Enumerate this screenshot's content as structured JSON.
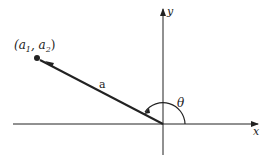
{
  "diagram": {
    "point_label": "(a",
    "point_sub1": "1",
    "comma": ", a",
    "point_sub2": "2",
    "close_paren": ")",
    "vector_label": "a",
    "angle_label": "θ",
    "x_axis_label": "x",
    "y_axis_label": "y",
    "colors": {
      "stroke": "#222222",
      "background": "#ffffff"
    }
  }
}
